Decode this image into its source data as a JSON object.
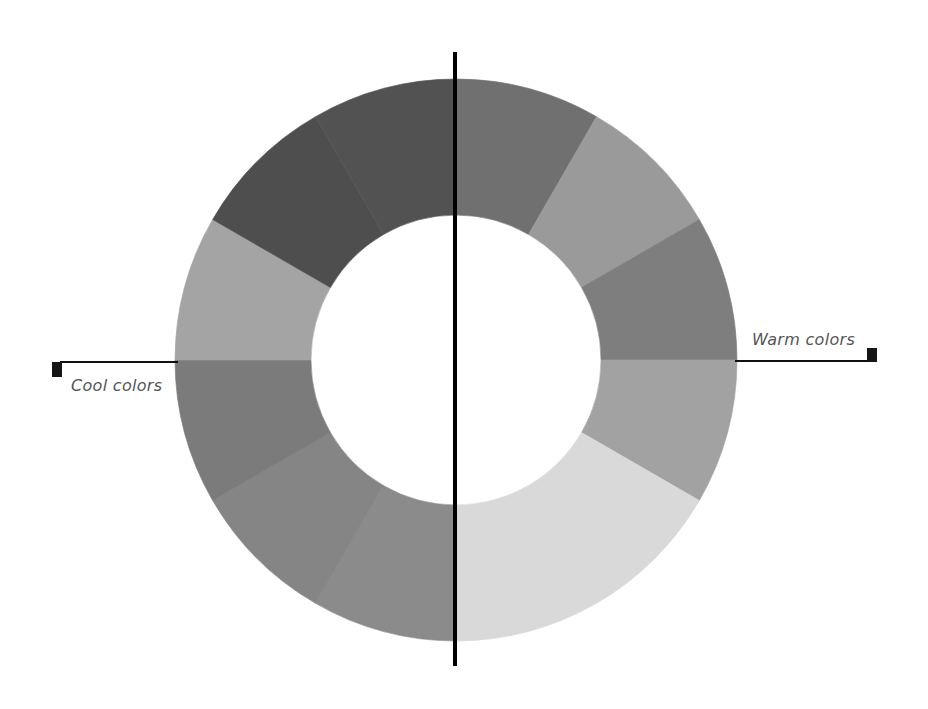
{
  "diagram": {
    "labels": {
      "cool": "Cool colors",
      "warm": "Warm colors"
    },
    "center": [
      456,
      360
    ],
    "outer_radius": 281,
    "inner_radius": 145,
    "segments": [
      {
        "side": "warm",
        "start_deg": 90,
        "end_deg": 60,
        "color": "#707070"
      },
      {
        "side": "warm",
        "start_deg": 60,
        "end_deg": 30,
        "color": "#9a9a9a"
      },
      {
        "side": "warm",
        "start_deg": 30,
        "end_deg": 0,
        "color": "#7e7e7e"
      },
      {
        "side": "warm",
        "start_deg": 0,
        "end_deg": -30,
        "color": "#a2a2a2"
      },
      {
        "side": "warm",
        "start_deg": -30,
        "end_deg": -90,
        "color": "#d9d9d9"
      },
      {
        "side": "cool",
        "start_deg": -90,
        "end_deg": -120,
        "color": "#8b8b8b"
      },
      {
        "side": "cool",
        "start_deg": -120,
        "end_deg": -150,
        "color": "#858585"
      },
      {
        "side": "cool",
        "start_deg": -150,
        "end_deg": -180,
        "color": "#7b7b7b"
      },
      {
        "side": "cool",
        "start_deg": 180,
        "end_deg": 150,
        "color": "#a4a4a4"
      },
      {
        "side": "cool",
        "start_deg": 150,
        "end_deg": 120,
        "color": "#4e4e4e"
      },
      {
        "side": "cool",
        "start_deg": 120,
        "end_deg": 90,
        "color": "#525252"
      }
    ],
    "divider": {
      "x": 455,
      "y1": 52,
      "y2": 666,
      "color": "#000000"
    },
    "colors": {
      "line": "#111111",
      "marker": "#151515",
      "text": "#555555"
    }
  }
}
